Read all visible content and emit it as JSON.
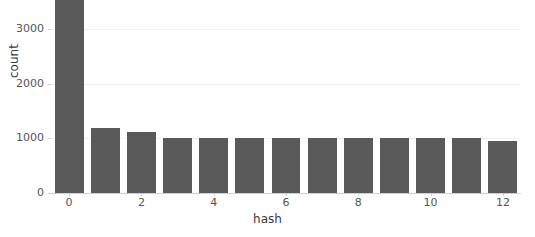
{
  "chart_data": {
    "type": "bar",
    "title": "",
    "xlabel": "hash",
    "ylabel": "count",
    "categories": [
      "0",
      "1",
      "2",
      "3",
      "4",
      "5",
      "6",
      "7",
      "8",
      "9",
      "10",
      "11",
      "12"
    ],
    "values": [
      3540,
      1190,
      1120,
      1010,
      1010,
      1000,
      1000,
      1010,
      1010,
      1000,
      1000,
      1010,
      960
    ],
    "xlim": [
      -0.5,
      12.5
    ],
    "ylim": [
      0,
      3540
    ],
    "yticks": [
      0,
      1000,
      2000,
      3000
    ],
    "ytick_labels": [
      "0",
      "1000",
      "2000",
      "3000"
    ],
    "xticks": [
      0,
      2,
      4,
      6,
      8,
      10,
      12
    ],
    "xtick_labels": [
      "0",
      "2",
      "4",
      "6",
      "8",
      "10",
      "12"
    ],
    "grid": true,
    "legend": null,
    "bar_color": "#595959",
    "grid_color": "#f2f2f2",
    "axis_color": "#cfcfcf",
    "tick_text_color": "#555555",
    "label_text_color": "#3a3a3a",
    "background_color": "#ffffff"
  }
}
